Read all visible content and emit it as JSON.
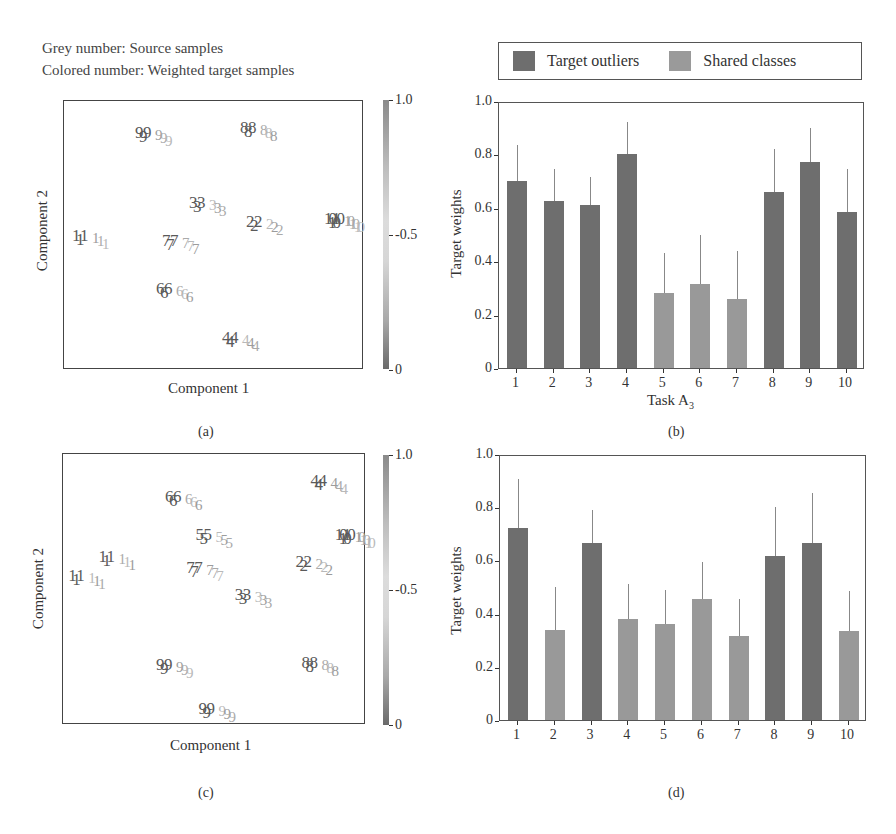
{
  "notes": {
    "line1": "Grey number: Source samples",
    "line2": "Colored number: Weighted target samples"
  },
  "legend": {
    "items": [
      {
        "label": "Target outliers",
        "color": "#6e6e6e"
      },
      {
        "label": "Shared classes",
        "color": "#999999"
      }
    ]
  },
  "colorbar": {
    "ticks": [
      "1.0",
      "-0.5",
      "0"
    ],
    "min": 0,
    "max": 1.0
  },
  "captions": {
    "a": "(a)",
    "b": "(b)",
    "c": "(c)",
    "d": "(d)"
  },
  "chart_data": [
    {
      "id": "a",
      "type": "scatter",
      "title": "",
      "xlabel": "Component 1",
      "ylabel": "Component 2",
      "note": "t-SNE embedding; digits are class labels; colorbar 0–1.0 shows target weights",
      "colorbar_ticks": [
        "0",
        "0.5",
        "1.0"
      ],
      "clusters": [
        {
          "label": "9",
          "x": 0.27,
          "y": 0.88
        },
        {
          "label": "8",
          "x": 0.62,
          "y": 0.9
        },
        {
          "label": "3",
          "x": 0.45,
          "y": 0.62
        },
        {
          "label": "1",
          "x": 0.06,
          "y": 0.5
        },
        {
          "label": "7",
          "x": 0.36,
          "y": 0.48
        },
        {
          "label": "2",
          "x": 0.64,
          "y": 0.55
        },
        {
          "label": "10",
          "x": 0.9,
          "y": 0.56
        },
        {
          "label": "6",
          "x": 0.34,
          "y": 0.3
        },
        {
          "label": "4",
          "x": 0.56,
          "y": 0.12
        }
      ]
    },
    {
      "id": "b",
      "type": "bar",
      "title": "",
      "xlabel": "Task A3",
      "ylabel": "Target weights",
      "ylim": [
        0,
        1.0
      ],
      "yticks": [
        "0",
        "0.2",
        "0.4",
        "0.6",
        "0.8",
        "1.0"
      ],
      "categories": [
        "1",
        "2",
        "3",
        "4",
        "5",
        "6",
        "7",
        "8",
        "9",
        "10"
      ],
      "values": [
        0.7,
        0.625,
        0.61,
        0.8,
        0.28,
        0.315,
        0.26,
        0.66,
        0.77,
        0.585
      ],
      "error_top": [
        0.835,
        0.745,
        0.715,
        0.92,
        0.43,
        0.5,
        0.44,
        0.82,
        0.9,
        0.745
      ],
      "groups": [
        "Target outliers",
        "Target outliers",
        "Target outliers",
        "Target outliers",
        "Shared classes",
        "Shared classes",
        "Shared classes",
        "Target outliers",
        "Target outliers",
        "Target outliers"
      ],
      "legend": [
        "Target outliers",
        "Shared classes"
      ],
      "legend_position": "top"
    },
    {
      "id": "c",
      "type": "scatter",
      "title": "",
      "xlabel": "Component 1",
      "ylabel": "Component 2",
      "colorbar_ticks": [
        "0",
        "0.5",
        "1.0"
      ],
      "clusters": [
        {
          "label": "4",
          "x": 0.85,
          "y": 0.9
        },
        {
          "label": "6",
          "x": 0.37,
          "y": 0.84
        },
        {
          "label": "5",
          "x": 0.47,
          "y": 0.7
        },
        {
          "label": "10",
          "x": 0.93,
          "y": 0.7
        },
        {
          "label": "1",
          "x": 0.15,
          "y": 0.62
        },
        {
          "label": "1",
          "x": 0.05,
          "y": 0.55
        },
        {
          "label": "7",
          "x": 0.44,
          "y": 0.58
        },
        {
          "label": "2",
          "x": 0.8,
          "y": 0.6
        },
        {
          "label": "3",
          "x": 0.6,
          "y": 0.48
        },
        {
          "label": "9",
          "x": 0.34,
          "y": 0.22
        },
        {
          "label": "8",
          "x": 0.82,
          "y": 0.23
        },
        {
          "label": "9",
          "x": 0.48,
          "y": 0.06
        }
      ]
    },
    {
      "id": "d",
      "type": "bar",
      "title": "",
      "xlabel": "",
      "ylabel": "Target weights",
      "ylim": [
        0,
        1.0
      ],
      "yticks": [
        "0",
        "0.2",
        "0.4",
        "0.6",
        "0.8",
        "1.0"
      ],
      "categories": [
        "1",
        "2",
        "3",
        "4",
        "5",
        "6",
        "7",
        "8",
        "9",
        "10"
      ],
      "values": [
        0.72,
        0.34,
        0.665,
        0.38,
        0.36,
        0.455,
        0.315,
        0.615,
        0.665,
        0.335
      ],
      "error_top": [
        0.905,
        0.5,
        0.79,
        0.51,
        0.49,
        0.595,
        0.455,
        0.8,
        0.855,
        0.485
      ],
      "groups": [
        "Target outliers",
        "Shared classes",
        "Target outliers",
        "Shared classes",
        "Shared classes",
        "Shared classes",
        "Shared classes",
        "Target outliers",
        "Target outliers",
        "Shared classes"
      ],
      "legend": [
        "Target outliers",
        "Shared classes"
      ]
    }
  ],
  "panels": {
    "a": {
      "xlabel": "Component 1",
      "ylabel": "Component 2"
    },
    "b": {
      "xlabel_main": "Task A",
      "xlabel_sub": "3",
      "ylabel": "Target weights"
    },
    "c": {
      "xlabel": "Component 1",
      "ylabel": "Component 2"
    },
    "d": {
      "ylabel": "Target weights"
    }
  }
}
